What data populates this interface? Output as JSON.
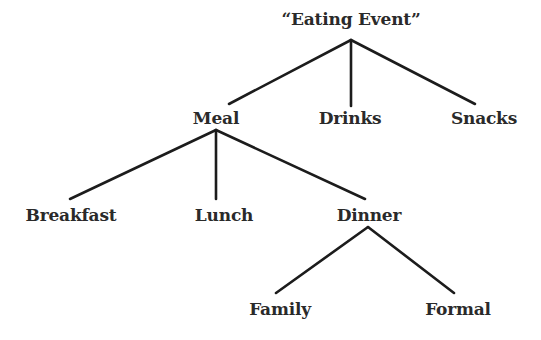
{
  "diagram": {
    "type": "tree",
    "colors": {
      "line": "#1c1c1c",
      "text": "#2a2a2a",
      "background": "#ffffff"
    },
    "nodes": [
      {
        "id": "eating_event",
        "label": "“Eating Event”",
        "x": 351,
        "y": 9
      },
      {
        "id": "meal",
        "label": "Meal",
        "x": 216,
        "y": 108
      },
      {
        "id": "drinks",
        "label": "Drinks",
        "x": 350,
        "y": 108
      },
      {
        "id": "snacks",
        "label": "Snacks",
        "x": 484,
        "y": 108
      },
      {
        "id": "breakfast",
        "label": "Breakfast",
        "x": 71,
        "y": 205
      },
      {
        "id": "lunch",
        "label": "Lunch",
        "x": 224,
        "y": 205
      },
      {
        "id": "dinner",
        "label": "Dinner",
        "x": 369,
        "y": 205
      },
      {
        "id": "family",
        "label": "Family",
        "x": 280,
        "y": 299
      },
      {
        "id": "formal",
        "label": "Formal",
        "x": 458,
        "y": 299
      }
    ],
    "edges": [
      {
        "from": "eating_event",
        "to": "meal",
        "x1": 351,
        "y1": 40,
        "x2": 229,
        "y2": 104
      },
      {
        "from": "eating_event",
        "to": "drinks",
        "x1": 351,
        "y1": 40,
        "x2": 351,
        "y2": 106
      },
      {
        "from": "eating_event",
        "to": "snacks",
        "x1": 351,
        "y1": 40,
        "x2": 475,
        "y2": 104
      },
      {
        "from": "meal",
        "to": "breakfast",
        "x1": 216,
        "y1": 130,
        "x2": 70,
        "y2": 199
      },
      {
        "from": "meal",
        "to": "lunch",
        "x1": 216,
        "y1": 130,
        "x2": 216,
        "y2": 199
      },
      {
        "from": "meal",
        "to": "dinner",
        "x1": 216,
        "y1": 130,
        "x2": 365,
        "y2": 199
      },
      {
        "from": "dinner",
        "to": "family",
        "x1": 368,
        "y1": 227,
        "x2": 276,
        "y2": 293
      },
      {
        "from": "dinner",
        "to": "formal",
        "x1": 368,
        "y1": 227,
        "x2": 454,
        "y2": 293
      }
    ]
  }
}
